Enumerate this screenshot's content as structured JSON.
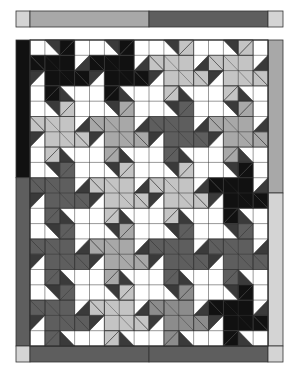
{
  "colors": {
    "background": "#ffffff",
    "outline": "#333333",
    "accent_dark": "#3a3a3a",
    "black": "#111111",
    "dark": "#5e5e5e",
    "mid": "#8c8c8c",
    "midlight": "#a8a8a8",
    "light": "#c4c4c4",
    "corner": "#d4d4d4"
  },
  "top_strip": {
    "segments": [
      {
        "color": "corner",
        "span": [
          16,
          30
        ]
      },
      {
        "color": "midlight",
        "span": [
          30,
          149
        ]
      },
      {
        "color": "dark",
        "span": [
          149,
          268
        ]
      },
      {
        "color": "corner",
        "span": [
          268,
          283
        ]
      }
    ]
  },
  "quilt": {
    "cols": 4,
    "rows": 5,
    "cells_per_block": 4,
    "stars": [
      [
        "black",
        "black",
        "light",
        "light"
      ],
      [
        "light",
        "midlight",
        "dark",
        "midlight"
      ],
      [
        "dark",
        "light",
        "light",
        "black"
      ],
      [
        "dark",
        "midlight",
        "dark",
        "dark"
      ],
      [
        "dark",
        "light",
        "mid",
        "black"
      ]
    ]
  },
  "borders": {
    "left": [
      {
        "color": "black",
        "rows": [
          0,
          9
        ]
      },
      {
        "color": "dark",
        "rows": [
          9,
          20
        ]
      }
    ],
    "right": [
      {
        "color": "midlight",
        "rows": [
          0,
          10
        ]
      },
      {
        "color": "corner",
        "rows": [
          10,
          20
        ]
      }
    ],
    "bottom": [
      {
        "color": "corner"
      },
      {
        "color": "dark"
      },
      {
        "color": "dark"
      },
      {
        "color": "corner"
      }
    ]
  }
}
